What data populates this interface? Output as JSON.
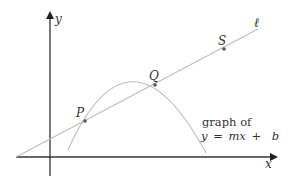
{
  "diagram": {
    "axes": {
      "x_label": "x",
      "y_label": "y",
      "color": "#333333"
    },
    "line": {
      "label": "ℓ",
      "color": "#b8b8b8"
    },
    "curve": {
      "color": "#b8b8b8"
    },
    "points": [
      {
        "name": "P"
      },
      {
        "name": "Q"
      },
      {
        "name": "S"
      }
    ],
    "annotation": {
      "line1": "graph of",
      "line2_lhs": "y",
      "line2_eq": "=",
      "line2_m": "mx",
      "line2_plus": "+",
      "line2_b": "b"
    },
    "point_color": "#555555"
  }
}
